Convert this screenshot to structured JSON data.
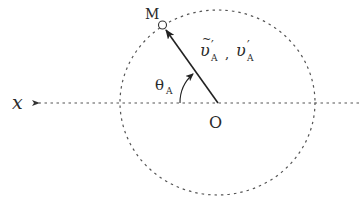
{
  "diagram": {
    "type": "geometry",
    "colors": {
      "stroke": "#333333",
      "dashed": "#555555",
      "text": "#2a2a2a",
      "background": "#ffffff"
    },
    "axis": {
      "label": "x",
      "direction": "left"
    },
    "origin": {
      "label": "O"
    },
    "point": {
      "label": "M"
    },
    "vector": {
      "label_tilde_symbol": "υ",
      "label_tilde_mark": "~",
      "label_prime": "′",
      "label_subscript": "A",
      "separator": ",",
      "label_plain_symbol": "υ"
    },
    "angle": {
      "symbol": "θ",
      "subscript": "A"
    },
    "circle": {
      "style": "dashed"
    }
  }
}
